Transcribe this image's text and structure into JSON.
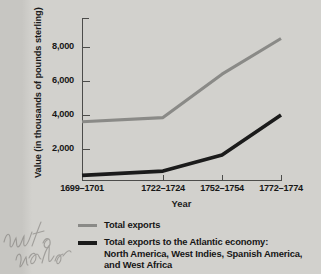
{
  "chart_data": {
    "type": "line",
    "title": "",
    "xlabel": "Year",
    "ylabel": "Value (in thousands of pounds sterling)",
    "categories": [
      "1699–1701",
      "1722–1724",
      "1752–1754",
      "1772–1774"
    ],
    "ytick_labels": [
      "2,000",
      "4,000",
      "6,000",
      "8,000"
    ],
    "ytick_values": [
      2000,
      4000,
      6000,
      8000
    ],
    "ylim": [
      0,
      9200
    ],
    "grid": false,
    "legend_position": "below",
    "series": [
      {
        "name": "Total exports",
        "color": "#8a8a87",
        "values": [
          3600,
          3850,
          6400,
          8500
        ]
      },
      {
        "name": "Total exports to the Atlantic economy: North America, West Indies, Spanish America, and West Africa",
        "color": "#1b1b1b",
        "values": [
          450,
          700,
          1650,
          4000
        ]
      }
    ]
  },
  "axes": {
    "y_title": "Value (in thousands of pounds sterling)",
    "x_title": "Year",
    "y_ticks": [
      "2,000",
      "4,000",
      "6,000",
      "8,000"
    ],
    "x_ticks": [
      "1699–1701",
      "1722–1724",
      "1752–1754",
      "1772–1774"
    ]
  },
  "legend": {
    "entries": [
      {
        "swatch": "gray-line-swatch",
        "lines": [
          "Total exports"
        ]
      },
      {
        "swatch": "black-line-swatch",
        "lines": [
          "Total exports to the Atlantic economy:",
          "North America, West Indies, Spanish America,",
          "and West Africa"
        ]
      }
    ]
  },
  "annotations": {
    "handwriting": "chart paper"
  },
  "colors": {
    "total_exports_line": "#8a8a87",
    "atlantic_economy_line": "#1b1b1b",
    "axis": "#4c4c4a",
    "page_background": "#d2d1cd",
    "margin_background": "#c7c6c2"
  }
}
